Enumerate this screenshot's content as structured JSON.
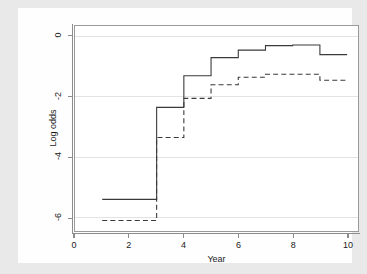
{
  "chart_data": {
    "type": "line",
    "line_style": "step",
    "title": "",
    "xlabel": "Year",
    "ylabel": "Log odds",
    "xlim": [
      0,
      10.4
    ],
    "ylim": [
      -6.45,
      0.35
    ],
    "xticks": [
      0,
      2,
      4,
      6,
      8,
      10
    ],
    "xtick_labels": [
      "0",
      "2",
      "4",
      "6",
      "8",
      "10"
    ],
    "yticks": [
      0,
      -2,
      -4,
      -6
    ],
    "ytick_labels": [
      "0",
      "-2",
      "-4",
      "-6"
    ],
    "grid": "horizontal",
    "grid_color": "#e3e3e3",
    "legend": "none",
    "axis_color": "#8c8c8c",
    "background": "#e9e9e9",
    "panel_background": "#ffffff",
    "series": [
      {
        "name": "solid",
        "style": "solid",
        "color": "#3a3a3a",
        "x_edges": [
          1,
          3,
          4,
          5,
          6,
          7,
          8,
          9,
          10
        ],
        "values": [
          -5.4,
          -2.35,
          -1.3,
          -0.7,
          -0.45,
          -0.3,
          -0.28,
          -0.6,
          -1.3
        ]
      },
      {
        "name": "dashed",
        "style": "dashed",
        "color": "#3a3a3a",
        "x_edges": [
          1,
          3,
          4,
          5,
          6,
          7,
          8,
          9,
          10
        ],
        "values": [
          -6.1,
          -3.35,
          -2.05,
          -1.6,
          -1.35,
          -1.25,
          -1.25,
          -1.45,
          -2.0
        ]
      }
    ]
  }
}
